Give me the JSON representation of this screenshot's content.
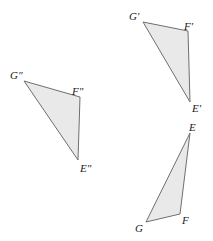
{
  "figure": {
    "background_color": "#ffffff",
    "fill_color": "#e9e9e9",
    "stroke_color": "#6f6f6f",
    "label_color": "#1a1a1a",
    "width": 213,
    "height": 241,
    "triangles": [
      {
        "id": "triangle-efg",
        "name": "EFG",
        "points": "190,133 180,214 146,222",
        "vertices": [
          {
            "label": "E",
            "label_x": 189,
            "label_y": 122,
            "x": 190,
            "y": 133
          },
          {
            "label": "F",
            "label_x": 182,
            "label_y": 215,
            "x": 180,
            "y": 214
          },
          {
            "label": "G",
            "label_x": 135,
            "label_y": 223,
            "x": 146,
            "y": 222
          }
        ]
      },
      {
        "id": "triangle-efg-prime",
        "name": "E'F'G'",
        "points": "190,102 188,31 143,22",
        "vertices": [
          {
            "label": "E'",
            "label_x": 192,
            "label_y": 103,
            "x": 190,
            "y": 102
          },
          {
            "label": "F'",
            "label_x": 184,
            "label_y": 21,
            "x": 188,
            "y": 31
          },
          {
            "label": "G'",
            "label_x": 129,
            "label_y": 11,
            "x": 143,
            "y": 22
          }
        ]
      },
      {
        "id": "triangle-efg-double-prime",
        "name": "E\"F\"G\"",
        "points": "78,160 80,97 24,81",
        "vertices": [
          {
            "label": "E\"",
            "label_x": 80,
            "label_y": 163,
            "x": 78,
            "y": 160
          },
          {
            "label": "F\"",
            "label_x": 72,
            "label_y": 86,
            "x": 80,
            "y": 97
          },
          {
            "label": "G\"",
            "label_x": 10,
            "label_y": 70,
            "x": 24,
            "y": 81
          }
        ]
      }
    ]
  }
}
